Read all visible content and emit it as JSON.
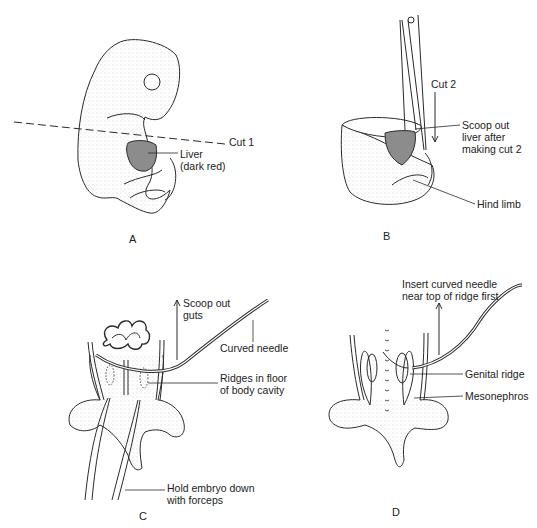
{
  "figure": {
    "panels": [
      {
        "id": "A",
        "letter": "A",
        "labels": {
          "cut": "Cut 1",
          "liver_line1": "Liver",
          "liver_line2": "(dark red)"
        }
      },
      {
        "id": "B",
        "letter": "B",
        "labels": {
          "cut": "Cut 2",
          "scoop_line1": "Scoop out",
          "scoop_line2": "liver after",
          "scoop_line3": "making cut 2",
          "hind_limb": "Hind limb"
        }
      },
      {
        "id": "C",
        "letter": "C",
        "labels": {
          "scoop_line1": "Scoop out",
          "scoop_line2": "guts",
          "needle": "Curved needle",
          "ridges_line1": "Ridges in floor",
          "ridges_line2": "of body cavity",
          "hold_line1": "Hold embryo down",
          "hold_line2": "with forceps"
        }
      },
      {
        "id": "D",
        "letter": "D",
        "labels": {
          "insert_line1": "Insert curved needle",
          "insert_line2": "near top of ridge first",
          "genital_ridge": "Genital ridge",
          "mesonephros": "Mesonephros"
        }
      }
    ],
    "colors": {
      "line": "#2a2a2a",
      "liver_fill": "#8c8c8c",
      "stipple": "#b5b5b5",
      "background": "#ffffff"
    }
  }
}
